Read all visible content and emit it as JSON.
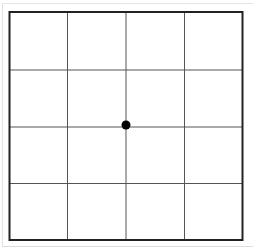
{
  "diagram": {
    "type": "grid",
    "rows": 4,
    "columns": 4,
    "outer_border": {
      "left": 9.5,
      "top": 12,
      "right": 242.5,
      "bottom": 240,
      "color": "#222222",
      "width": 2
    },
    "vertical_lines": [
      67.5,
      126,
      184.5
    ],
    "horizontal_lines": [
      70,
      127,
      183.5
    ],
    "grid_line_color": "#555555",
    "marker": {
      "shape": "dot",
      "cx": 126,
      "cy": 125,
      "r": 4.5,
      "color": "#000000"
    }
  }
}
